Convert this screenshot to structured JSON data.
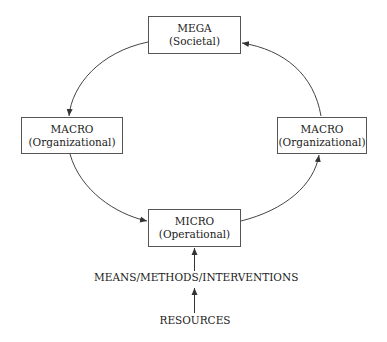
{
  "diagram": {
    "nodes": {
      "mega": {
        "title": "MEGA",
        "subtitle": "(Societal)"
      },
      "macro_left": {
        "title": "MACRO",
        "subtitle": "(Organizational)"
      },
      "macro_right": {
        "title": "MACRO",
        "subtitle": "(Organizational)"
      },
      "micro": {
        "title": "MICRO",
        "subtitle": "(Operational)"
      }
    },
    "labels": {
      "means": "MEANS/METHODS/INTERVENTIONS",
      "resources": "RESOURCES"
    },
    "edges": [
      {
        "from": "MEGA",
        "to": "MACRO (left)"
      },
      {
        "from": "MACRO (left)",
        "to": "MICRO"
      },
      {
        "from": "MICRO",
        "to": "MACRO (right)"
      },
      {
        "from": "MACRO (right)",
        "to": "MEGA"
      },
      {
        "from": "MEANS/METHODS/INTERVENTIONS",
        "to": "MICRO"
      },
      {
        "from": "RESOURCES",
        "to": "MEANS/METHODS/INTERVENTIONS"
      }
    ],
    "colors": {
      "stroke": "#444444",
      "box_border": "#555555",
      "text": "#222222"
    }
  }
}
